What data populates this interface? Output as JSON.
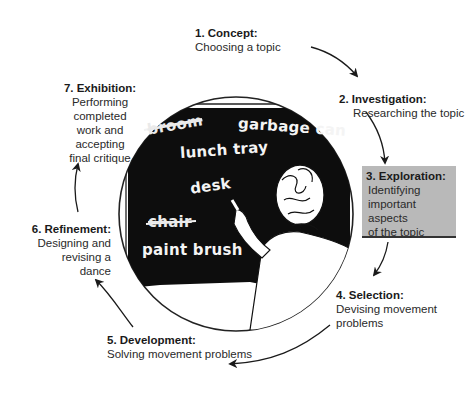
{
  "diagram": {
    "type": "cycle",
    "stages": [
      {
        "number": "1",
        "title": "1. Concept:",
        "description": "Choosing a topic"
      },
      {
        "number": "2",
        "title": "2. Investigation:",
        "description": "Researching the topic"
      },
      {
        "number": "3",
        "title": "3. Exploration:",
        "description": "Identifying\n important\naspects\nof the topic",
        "highlighted": true
      },
      {
        "number": "4",
        "title": "4. Selection:",
        "description": "Devising movement\nproblems"
      },
      {
        "number": "5",
        "title": "5. Development:",
        "description": "Solving movement problems"
      },
      {
        "number": "6",
        "title": "6. Refinement:",
        "description": "Designing and\nrevising a\ndance"
      },
      {
        "number": "7",
        "title": "7. Exhibition:",
        "description": "Performing\ncompleted\nwork and\naccepting\nfinal critique"
      }
    ],
    "chalkboard_words": [
      {
        "text": "broom",
        "crossed_out": true
      },
      {
        "text": "garbage can",
        "crossed_out": false
      },
      {
        "text": "lunch tray",
        "crossed_out": false
      },
      {
        "text": "desk",
        "crossed_out": false
      },
      {
        "text": "chair",
        "crossed_out": true
      },
      {
        "text": "paint brush",
        "crossed_out": false
      }
    ],
    "colors": {
      "highlight_box": "#b9b9b9",
      "chalkboard": "#0d0d0d",
      "line": "#222222"
    }
  }
}
